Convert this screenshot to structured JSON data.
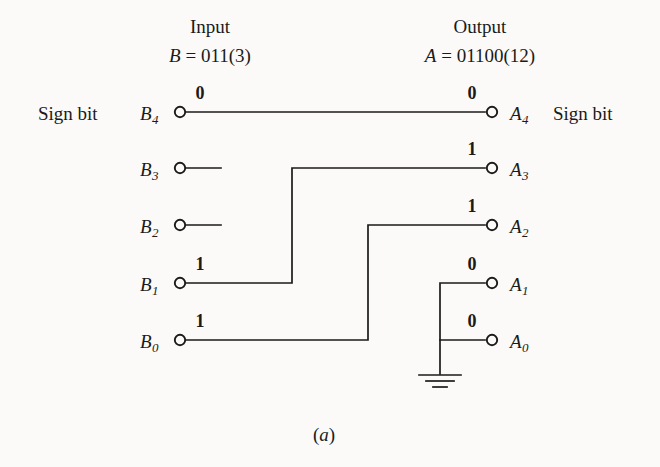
{
  "figure": {
    "caption": "(a)",
    "caption_open": "(",
    "caption_letter": "a",
    "caption_close": ")"
  },
  "input_column": {
    "heading": "Input",
    "signal_name": "B",
    "equals": "=",
    "value": "011(3)",
    "sign_bit_label": "Sign bit",
    "terminals": [
      {
        "name": "B",
        "subscript": "4",
        "bit": "0"
      },
      {
        "name": "B",
        "subscript": "3",
        "bit": ""
      },
      {
        "name": "B",
        "subscript": "2",
        "bit": ""
      },
      {
        "name": "B",
        "subscript": "1",
        "bit": "1"
      },
      {
        "name": "B",
        "subscript": "0",
        "bit": "1"
      }
    ]
  },
  "output_column": {
    "heading": "Output",
    "signal_name": "A",
    "equals": "=",
    "value": "01100(12)",
    "sign_bit_label": "Sign bit",
    "terminals": [
      {
        "name": "A",
        "subscript": "4",
        "bit": "0"
      },
      {
        "name": "A",
        "subscript": "3",
        "bit": "1"
      },
      {
        "name": "A",
        "subscript": "2",
        "bit": "1"
      },
      {
        "name": "A",
        "subscript": "1",
        "bit": "0"
      },
      {
        "name": "A",
        "subscript": "0",
        "bit": "0"
      }
    ]
  },
  "connections": [
    {
      "from": "B4",
      "to": "A4",
      "kind": "straight"
    },
    {
      "from": "B3",
      "to": "",
      "kind": "open-stub"
    },
    {
      "from": "B2",
      "to": "",
      "kind": "open-stub"
    },
    {
      "from": "B1",
      "to": "A3",
      "kind": "routed"
    },
    {
      "from": "B0",
      "to": "A2",
      "kind": "routed"
    },
    {
      "from": "ground",
      "to": "A1",
      "kind": "ground"
    },
    {
      "from": "ground",
      "to": "A0",
      "kind": "ground"
    }
  ],
  "ground": {
    "symbol": "earth-ground"
  },
  "colors": {
    "ink": "#1a1a1a",
    "paper": "#fbfaf8"
  }
}
